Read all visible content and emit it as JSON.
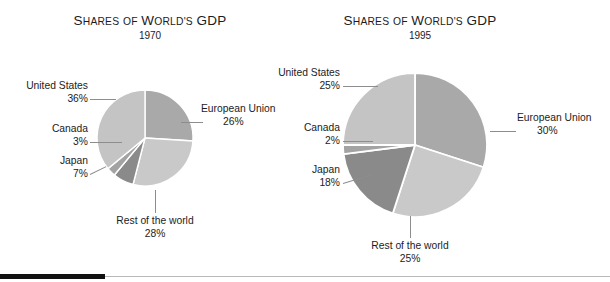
{
  "figure": {
    "background_color": "#ffffff",
    "bottom_rule": {
      "thick_color": "#111111",
      "thick_width": 105,
      "thin_color": "#b9b9b9"
    }
  },
  "charts": [
    {
      "title_words": {
        "w1_cap": "S",
        "w1_rest": "HARES",
        "w2": "OF",
        "w3_cap": "W",
        "w3_rest": "ORLD'S",
        "w4": "GDP"
      },
      "title_text": "SHARES OF WORLD'S GDP",
      "year": "1970",
      "labels": [
        {
          "name": "United States",
          "value": "36%"
        },
        {
          "name": "Canada",
          "value": "3%"
        },
        {
          "name": "Japan",
          "value": "7%"
        },
        {
          "name": "European Union",
          "value": "26%"
        },
        {
          "name": "Rest of the world",
          "value": "28%"
        }
      ]
    },
    {
      "title_words": {
        "w1_cap": "S",
        "w1_rest": "HARES",
        "w2": "OF",
        "w3_cap": "W",
        "w3_rest": "ORLD'S",
        "w4": "GDP"
      },
      "title_text": "SHARES OF WORLD'S GDP",
      "year": "1995",
      "labels": [
        {
          "name": "United States",
          "value": "25%"
        },
        {
          "name": "Canada",
          "value": "2%"
        },
        {
          "name": "Japan",
          "value": "18%"
        },
        {
          "name": "European Union",
          "value": "30%"
        },
        {
          "name": "Rest of the world",
          "value": "25%"
        }
      ]
    }
  ],
  "chart_data": [
    {
      "type": "pie",
      "title": "SHARES OF WORLD'S GDP",
      "subtitle": "1970",
      "xlabel": "",
      "ylabel": "",
      "grid": false,
      "legend_position": "callout-labels",
      "start_angle_deg": 0,
      "direction": "clockwise",
      "units": "percent of world GDP",
      "center": {
        "x": 145,
        "y": 138
      },
      "radius": 48,
      "categories": [
        "European Union",
        "Rest of the world",
        "Japan",
        "Canada",
        "United States"
      ],
      "values": [
        26,
        28,
        7,
        3,
        36
      ],
      "slice_colors": [
        "#a9a9a9",
        "#c9c9c9",
        "#8a8a8a",
        "#a3a3a3",
        "#c4c4c4"
      ],
      "annotations": [
        "United States 36%",
        "Canada 3%",
        "Japan 7%",
        "European Union 26%",
        "Rest of the world 28%"
      ]
    },
    {
      "type": "pie",
      "title": "SHARES OF WORLD'S GDP",
      "subtitle": "1995",
      "xlabel": "",
      "ylabel": "",
      "grid": false,
      "legend_position": "callout-labels",
      "start_angle_deg": 0,
      "direction": "clockwise",
      "units": "percent of world GDP",
      "center": {
        "x": 415,
        "y": 145
      },
      "radius": 72,
      "categories": [
        "European Union",
        "Rest of the world",
        "Japan",
        "Canada",
        "United States"
      ],
      "values": [
        30,
        25,
        18,
        2,
        25
      ],
      "slice_colors": [
        "#a9a9a9",
        "#c9c9c9",
        "#8a8a8a",
        "#a3a3a3",
        "#c4c4c4"
      ],
      "annotations": [
        "United States 25%",
        "Canada 2%",
        "Japan 18%",
        "European Union 30%",
        "Rest of the world 25%"
      ]
    }
  ]
}
